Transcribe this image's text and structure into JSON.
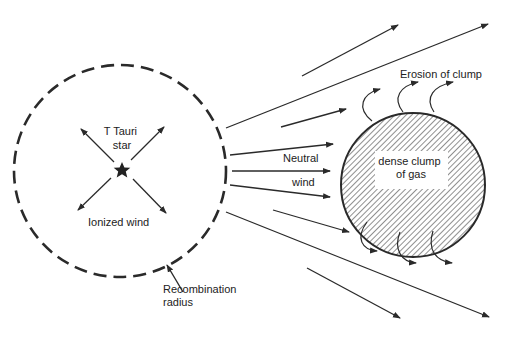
{
  "diagram": {
    "labels": {
      "star_line1": "T Tauri",
      "star_line2": "star",
      "ionized_wind": "Ionized wind",
      "recomb_line1": "Recombination",
      "recomb_line2": "radius",
      "neutral": "Neutral",
      "wind": "wind",
      "erosion": "Erosion of clump",
      "clump_line1": "dense clump",
      "clump_line2": "of gas"
    },
    "colors": {
      "stroke": "#2a2a2a",
      "background": "#ffffff",
      "hatch": "#333333"
    },
    "elements": {
      "recombination_circle": {
        "cx": 120,
        "cy": 171,
        "r": 106,
        "style": "dashed"
      },
      "star": {
        "cx": 122,
        "cy": 170
      },
      "clump": {
        "cx": 413,
        "cy": 185,
        "r": 72,
        "fill": "hatched"
      }
    }
  }
}
